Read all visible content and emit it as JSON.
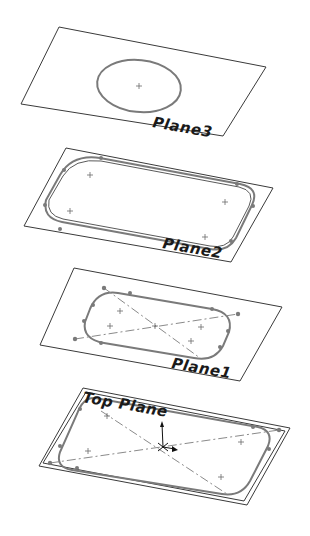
{
  "diagram": {
    "type": "isometric-sketch-planes",
    "planes": [
      {
        "id": "plane3",
        "label": "Plane3",
        "corners": [
          [
            59,
            27
          ],
          [
            266,
            67
          ],
          [
            223,
            136
          ],
          [
            21,
            104
          ]
        ],
        "label_pos": [
          152,
          128
        ],
        "sketch": "circle"
      },
      {
        "id": "plane2",
        "label": "Plane2",
        "corners": [
          [
            66,
            148
          ],
          [
            273,
            188
          ],
          [
            231,
            262
          ],
          [
            24,
            226
          ]
        ],
        "label_pos": [
          160,
          250
        ],
        "sketch": "rounded-rectangle"
      },
      {
        "id": "plane1",
        "label": "Plane1",
        "corners": [
          [
            74,
            268
          ],
          [
            282,
            307
          ],
          [
            240,
            381
          ],
          [
            40,
            345
          ]
        ],
        "label_pos": [
          170,
          369
        ],
        "sketch": "slot-with-centerlines"
      },
      {
        "id": "top-plane",
        "label": "Top Plane",
        "corners": [
          [
            83,
            388
          ],
          [
            290,
            428
          ],
          [
            247,
            505
          ],
          [
            39,
            466
          ]
        ],
        "label_pos": [
          82,
          402
        ],
        "sketch": "rounded-rectangle-with-centerlines-and-origin"
      }
    ],
    "colors": {
      "plane_outline": "#3a3a3a",
      "sketch": "#7a7a7a",
      "label": "#1a1a1a",
      "background": "#ffffff"
    }
  }
}
